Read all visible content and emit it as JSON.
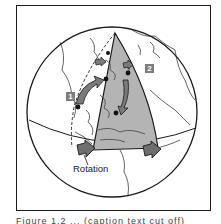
{
  "figure": {
    "labels": {
      "rotation": "Rotation",
      "marker_1": "1",
      "marker_2": "2"
    },
    "caption": "Figure 1.2 ... (caption text cut off)",
    "colors": {
      "wedge_fill": "#b4b4b4",
      "arrow_fill": "#7a7a7a",
      "label_box": "#7d7d7d",
      "outline": "#1a1a1a"
    }
  }
}
